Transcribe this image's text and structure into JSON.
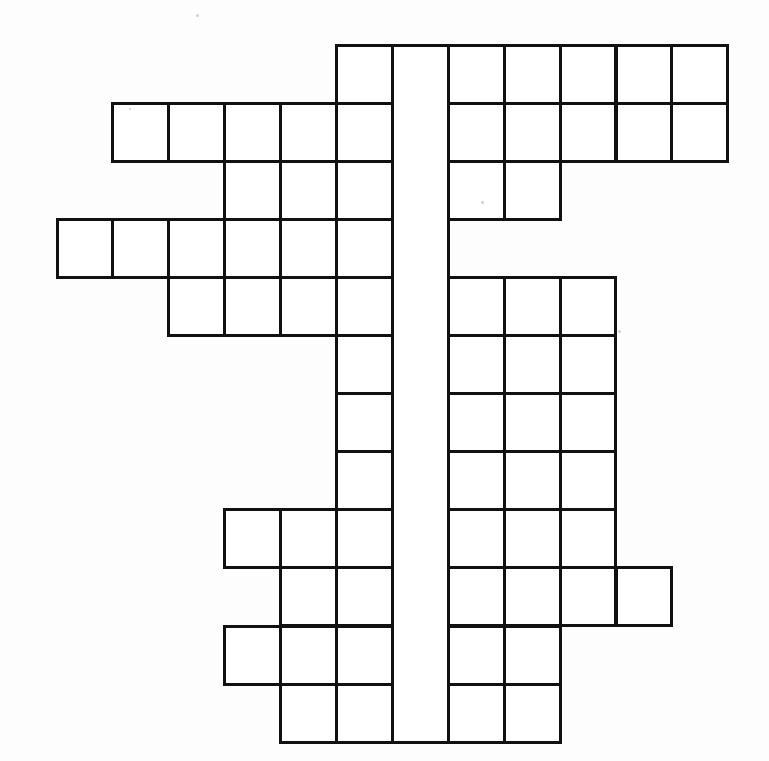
{
  "document": {
    "type": "crossword-grid",
    "title": "Blank crossword puzzle grid",
    "background_color": "#fdfdfd",
    "line_color": "#111111",
    "cell_fill_color": "#ffffff"
  },
  "grid": {
    "columns": 12,
    "rows": 12,
    "origin_x": 57,
    "origin_y": 45,
    "cell_width": 55.9,
    "cell_height": 58.1,
    "line_width": 3,
    "spine_column_index": 6,
    "spine_note": "column 6 is drawn as one continuous tall rectangle with no internal horizontal dividers",
    "row_cells": [
      {
        "row": 0,
        "cols": [
          5,
          6,
          7,
          8,
          9,
          10,
          11
        ]
      },
      {
        "row": 1,
        "cols": [
          1,
          2,
          3,
          4,
          5,
          6,
          7,
          8,
          9,
          10,
          11
        ]
      },
      {
        "row": 2,
        "cols": [
          3,
          4,
          5,
          6,
          7,
          8
        ]
      },
      {
        "row": 3,
        "cols": [
          0,
          1,
          2,
          3,
          4,
          5,
          6
        ]
      },
      {
        "row": 4,
        "cols": [
          2,
          3,
          4,
          5,
          6,
          7,
          8,
          9
        ]
      },
      {
        "row": 5,
        "cols": [
          5,
          6,
          7,
          8,
          9
        ]
      },
      {
        "row": 6,
        "cols": [
          5,
          6,
          7,
          8,
          9
        ]
      },
      {
        "row": 7,
        "cols": [
          5,
          6,
          7,
          8,
          9
        ]
      },
      {
        "row": 8,
        "cols": [
          3,
          4,
          5,
          6,
          7,
          8,
          9
        ]
      },
      {
        "row": 9,
        "cols": [
          4,
          5,
          6,
          7,
          8,
          9,
          10
        ]
      },
      {
        "row": 10,
        "cols": [
          3,
          4,
          5,
          6,
          7,
          8
        ]
      },
      {
        "row": 11,
        "cols": [
          4,
          5,
          6,
          7,
          8
        ]
      }
    ]
  },
  "specks": [
    {
      "x": 196,
      "y": 14,
      "size": 3
    },
    {
      "x": 481,
      "y": 201,
      "size": 3
    },
    {
      "x": 618,
      "y": 330,
      "size": 3
    },
    {
      "x": 129,
      "y": 108,
      "size": 2
    }
  ]
}
